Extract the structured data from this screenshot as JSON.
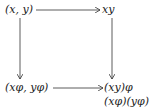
{
  "diagram": {
    "type": "commutative-square",
    "nodes": {
      "top_left": "(x, y)",
      "top_right": "xy",
      "bottom_left": "(xφ, yφ)",
      "bottom_right_line1": "(xy)φ",
      "bottom_right_line2": "(xφ)(yφ)"
    },
    "edges": [
      {
        "from": "top_left",
        "to": "top_right",
        "direction": "right"
      },
      {
        "from": "top_left",
        "to": "bottom_left",
        "direction": "down"
      },
      {
        "from": "top_right",
        "to": "bottom_right",
        "direction": "down"
      },
      {
        "from": "bottom_left",
        "to": "bottom_right",
        "direction": "right"
      }
    ],
    "stroke_color": "#333333"
  }
}
